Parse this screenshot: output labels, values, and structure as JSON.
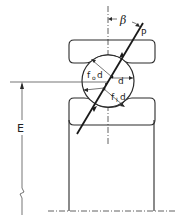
{
  "diagram": {
    "labels": {
      "contact_angle": "β",
      "load": "P",
      "outer_radius_main": "f",
      "outer_radius_sub": "o",
      "outer_radius_tail": "d",
      "ball_diameter": "d",
      "inner_radius_main": "f",
      "inner_radius_sub": "I",
      "inner_radius_tail": "d",
      "pitch_height": "E"
    },
    "colors": {
      "line": "#2a2a2a",
      "background": "#ffffff"
    }
  }
}
